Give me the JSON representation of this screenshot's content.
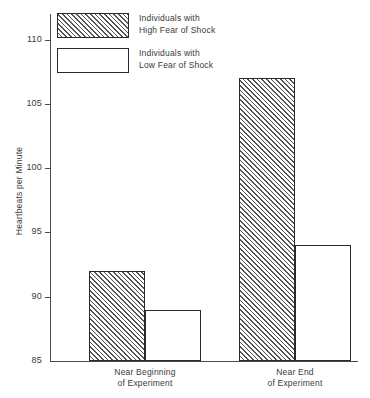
{
  "chart_data": {
    "type": "bar",
    "title": "",
    "xlabel": "",
    "ylabel": "Heartbeats per Minute",
    "ylim": [
      85,
      112
    ],
    "yticks": [
      85,
      90,
      95,
      100,
      105,
      110
    ],
    "ytick_labels": [
      "85",
      "90",
      "95",
      "100",
      "105",
      "110"
    ],
    "grid": false,
    "legend_position": "top-left",
    "categories": [
      "Near Beginning of Experiment",
      "Near End of Experiment"
    ],
    "category_lines": [
      [
        "Near Beginning",
        "of Experiment"
      ],
      [
        "Near End",
        "of Experiment"
      ]
    ],
    "series": [
      {
        "name": "Individuals with High Fear of Shock",
        "name_lines": [
          "Individuals with",
          "High Fear of Shock"
        ],
        "fill": "hatched",
        "values": [
          92,
          107
        ]
      },
      {
        "name": "Individuals with Low Fear of Shock",
        "name_lines": [
          "Individuals with",
          "Low Fear of Shock"
        ],
        "fill": "white",
        "values": [
          89,
          94
        ]
      }
    ]
  },
  "colors": {
    "axis": "#4a4a4a",
    "bar_outline": "#2a2a2a",
    "hatch": "#555555",
    "bar_fill": "#ffffff",
    "text": "#3a3a3a",
    "background": "#ffffff"
  }
}
